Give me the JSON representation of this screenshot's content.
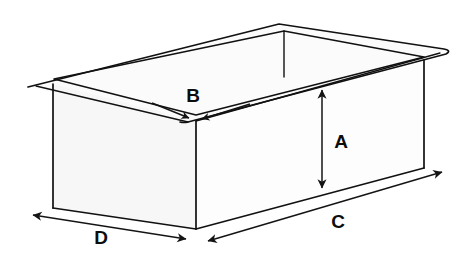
{
  "diagram": {
    "background_color": "#ffffff",
    "line_color": "#111111",
    "label_color": "#0d0d0d",
    "face_colors": {
      "interior_back_wall": "#e8e8e8",
      "interior_floor": "#f4f4f4",
      "rim_top": "#fbfbfb",
      "front_left_face": "#f7f7f7",
      "front_right_face": "#fdfdfd"
    },
    "labels": [
      {
        "id": "A",
        "text": "A",
        "measures": "height",
        "arrow_type": "double-headed-vertical",
        "x": 341,
        "y": 143
      },
      {
        "id": "B",
        "text": "B",
        "measures": "rim-wall-thickness",
        "arrow_type": "double-inward",
        "x": 193,
        "y": 97
      },
      {
        "id": "C",
        "text": "C",
        "measures": "long-bottom-edge",
        "arrow_type": "double-headed-diagonal",
        "x": 338,
        "y": 223
      },
      {
        "id": "D",
        "text": "D",
        "measures": "short-bottom-edge",
        "arrow_type": "double-headed-diagonal",
        "x": 101,
        "y": 239
      }
    ]
  }
}
